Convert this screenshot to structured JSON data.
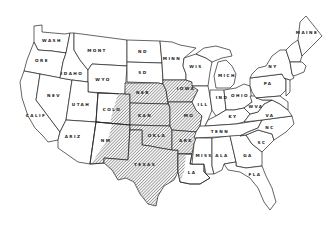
{
  "map": {
    "title": "",
    "hatch_color": "#555555",
    "line_color": "#222222",
    "states": [
      {
        "id": "wash",
        "label": "WASH",
        "x": 52,
        "y": 42,
        "hatched": false
      },
      {
        "id": "ore",
        "label": "ORE",
        "x": 42,
        "y": 62,
        "hatched": false
      },
      {
        "id": "calif",
        "label": "CALIF",
        "x": 36,
        "y": 117,
        "hatched": false
      },
      {
        "id": "nev",
        "label": "NEV",
        "x": 54,
        "y": 97,
        "hatched": false
      },
      {
        "id": "idaho",
        "label": "IDAHO",
        "x": 72,
        "y": 75,
        "hatched": false
      },
      {
        "id": "mont",
        "label": "MONT",
        "x": 97,
        "y": 52,
        "hatched": false
      },
      {
        "id": "wyo",
        "label": "WYO",
        "x": 103,
        "y": 81,
        "hatched": false
      },
      {
        "id": "utah",
        "label": "UTAH",
        "x": 81,
        "y": 106,
        "hatched": false
      },
      {
        "id": "colo",
        "label": "COLO",
        "x": 112,
        "y": 111,
        "hatched": "partial"
      },
      {
        "id": "ariz",
        "label": "ARIZ",
        "x": 73,
        "y": 138,
        "hatched": false
      },
      {
        "id": "nm",
        "label": "NM",
        "x": 106,
        "y": 142,
        "hatched": "partial"
      },
      {
        "id": "nd",
        "label": "ND",
        "x": 143,
        "y": 53,
        "hatched": false
      },
      {
        "id": "sd",
        "label": "SD",
        "x": 143,
        "y": 74,
        "hatched": false
      },
      {
        "id": "nebr",
        "label": "NEB",
        "x": 143,
        "y": 94,
        "hatched": true
      },
      {
        "id": "kan",
        "label": "KAN",
        "x": 145,
        "y": 117,
        "hatched": true
      },
      {
        "id": "okla",
        "label": "OKLA",
        "x": 157,
        "y": 137,
        "hatched": true
      },
      {
        "id": "texas",
        "label": "TEXAS",
        "x": 145,
        "y": 166,
        "hatched": true
      },
      {
        "id": "minn",
        "label": "MINN",
        "x": 172,
        "y": 60,
        "hatched": false
      },
      {
        "id": "iowa",
        "label": "IOWA",
        "x": 186,
        "y": 90,
        "hatched": true
      },
      {
        "id": "mo",
        "label": "MO",
        "x": 189,
        "y": 117,
        "hatched": true
      },
      {
        "id": "ark",
        "label": "ARK",
        "x": 186,
        "y": 142,
        "hatched": true
      },
      {
        "id": "la",
        "label": "LA",
        "x": 192,
        "y": 174,
        "hatched": "partial"
      },
      {
        "id": "wis",
        "label": "WIS",
        "x": 196,
        "y": 68,
        "hatched": false
      },
      {
        "id": "ill",
        "label": "ILL",
        "x": 203,
        "y": 106,
        "hatched": false
      },
      {
        "id": "mich",
        "label": "MICH",
        "x": 227,
        "y": 77,
        "hatched": false
      },
      {
        "id": "ind",
        "label": "IND",
        "x": 222,
        "y": 99,
        "hatched": false
      },
      {
        "id": "ohio",
        "label": "OHIO",
        "x": 240,
        "y": 97,
        "hatched": false
      },
      {
        "id": "ky",
        "label": "KY",
        "x": 233,
        "y": 118,
        "hatched": false
      },
      {
        "id": "tenn",
        "label": "TENN",
        "x": 220,
        "y": 133,
        "hatched": false
      },
      {
        "id": "miss",
        "label": "MISS",
        "x": 204,
        "y": 157,
        "hatched": false
      },
      {
        "id": "ala",
        "label": "ALA",
        "x": 222,
        "y": 157,
        "hatched": false
      },
      {
        "id": "ga",
        "label": "GA",
        "x": 248,
        "y": 157,
        "hatched": false
      },
      {
        "id": "fla",
        "label": "FLA",
        "x": 255,
        "y": 176,
        "hatched": false
      },
      {
        "id": "sc",
        "label": "SC",
        "x": 262,
        "y": 144,
        "hatched": false
      },
      {
        "id": "nc",
        "label": "NC",
        "x": 270,
        "y": 129,
        "hatched": false
      },
      {
        "id": "va",
        "label": "VA",
        "x": 270,
        "y": 117,
        "hatched": false
      },
      {
        "id": "wva",
        "label": "WVA",
        "x": 256,
        "y": 108,
        "hatched": false
      },
      {
        "id": "pa",
        "label": "PA",
        "x": 268,
        "y": 85,
        "hatched": false
      },
      {
        "id": "ny",
        "label": "NY",
        "x": 273,
        "y": 68,
        "hatched": false
      },
      {
        "id": "maine",
        "label": "MAINE",
        "x": 307,
        "y": 34,
        "hatched": false
      }
    ]
  }
}
